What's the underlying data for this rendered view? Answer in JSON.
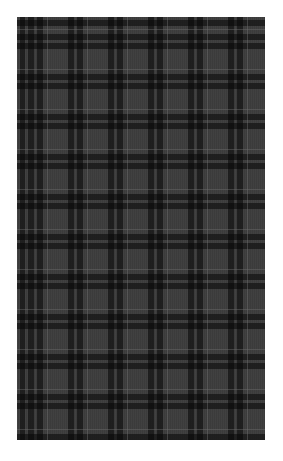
{
  "image": {
    "subject": "charcoal plaid fabric swatch",
    "colors": {
      "background": "#ffffff",
      "base": "#3b3b3b",
      "dark_stripe": "#0d0d0d",
      "light_line": "#6e6e6e"
    },
    "pattern": {
      "type": "tartan",
      "repeat_px": 40
    }
  }
}
